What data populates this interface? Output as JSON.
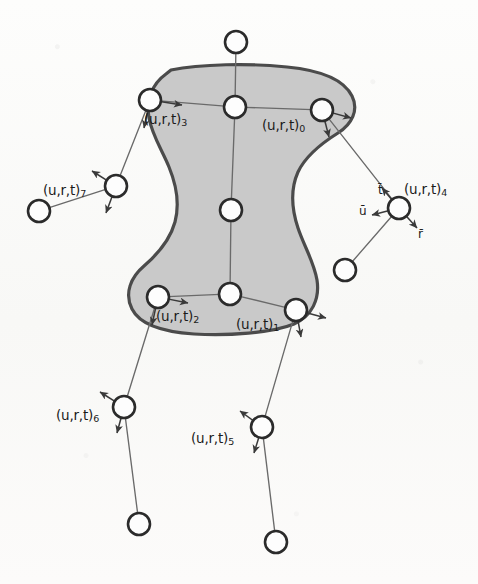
{
  "figure": {
    "background_color": "#fbfbfa",
    "blob_fill_color": "#c9c9c9",
    "blob_stroke_color": "#4b4b4b",
    "node_stroke_color": "#2b2b2b",
    "node_fill_color": "#fdfdfd",
    "link_color": "#6a6a6a",
    "arrow_color": "#3a3a3a",
    "text_color": "#1b1b1b"
  },
  "control_points": [
    {
      "id": "cp0",
      "label_base": "(u,r,t)",
      "index": "0",
      "cx": 322,
      "cy": 110,
      "r": 11,
      "inside_blob": true,
      "label_x": 262,
      "label_y": 119
    },
    {
      "id": "cp1",
      "label_base": "(u,r,t)",
      "index": "1",
      "cx": 296,
      "cy": 310,
      "r": 11,
      "inside_blob": true,
      "label_x": 236,
      "label_y": 318
    },
    {
      "id": "cp2",
      "label_base": "(u,r,t)",
      "index": "2",
      "cx": 158,
      "cy": 297,
      "r": 11,
      "inside_blob": true,
      "label_x": 156,
      "label_y": 310
    },
    {
      "id": "cp3",
      "label_base": "(u,r,t)",
      "index": "3",
      "cx": 150,
      "cy": 100,
      "r": 11,
      "inside_blob": true,
      "label_x": 144,
      "label_y": 113
    },
    {
      "id": "cp4",
      "label_base": "(u,r,t)",
      "index": "4",
      "cx": 399,
      "cy": 208,
      "r": 11,
      "inside_blob": false,
      "label_x": 404,
      "label_y": 183
    },
    {
      "id": "cp5",
      "label_base": "(u,r,t)",
      "index": "5",
      "cx": 262,
      "cy": 427,
      "r": 11,
      "inside_blob": false,
      "label_x": 191,
      "label_y": 432
    },
    {
      "id": "cp6",
      "label_base": "(u,r,t)",
      "index": "6",
      "cx": 124,
      "cy": 407,
      "r": 11,
      "inside_blob": false,
      "label_x": 56,
      "label_y": 409
    },
    {
      "id": "cp7",
      "label_base": "(u,r,t)",
      "index": "7",
      "cx": 116,
      "cy": 186,
      "r": 11,
      "inside_blob": false,
      "label_x": 43,
      "label_y": 184
    }
  ],
  "plain_nodes": [
    {
      "id": "n-top",
      "cx": 236,
      "cy": 42,
      "r": 11
    },
    {
      "id": "n-spine-top",
      "cx": 235,
      "cy": 107,
      "r": 11
    },
    {
      "id": "n-spine-mid",
      "cx": 231,
      "cy": 210,
      "r": 11
    },
    {
      "id": "n-spine-bot",
      "cx": 230,
      "cy": 294,
      "r": 11
    },
    {
      "id": "n-left-outer",
      "cx": 39,
      "cy": 211,
      "r": 11
    },
    {
      "id": "n-right-outer",
      "cx": 345,
      "cy": 270,
      "r": 11
    },
    {
      "id": "n-bot-left",
      "cx": 139,
      "cy": 524,
      "r": 11
    },
    {
      "id": "n-bot-right",
      "cx": 276,
      "cy": 542,
      "r": 11
    }
  ],
  "links": [
    {
      "id": "lk-top-spine",
      "from": "n-top",
      "to": "n-spine-top"
    },
    {
      "id": "lk-spine-upper",
      "from": "n-spine-top",
      "to": "n-spine-mid"
    },
    {
      "id": "lk-spine-lower",
      "from": "n-spine-mid",
      "to": "n-spine-bot"
    },
    {
      "id": "lk-cp3-spine",
      "from": "cp3",
      "to": "n-spine-top"
    },
    {
      "id": "lk-spine-cp0",
      "from": "n-spine-top",
      "to": "cp0"
    },
    {
      "id": "lk-cp2-spineb",
      "from": "cp2",
      "to": "n-spine-bot"
    },
    {
      "id": "lk-spineb-cp1",
      "from": "n-spine-bot",
      "to": "cp1"
    },
    {
      "id": "lk-cp3-cp7",
      "from": "cp3",
      "to": "cp7"
    },
    {
      "id": "lk-cp7-left",
      "from": "cp7",
      "to": "n-left-outer"
    },
    {
      "id": "lk-cp0-cp4",
      "from": "cp0",
      "to": "cp4"
    },
    {
      "id": "lk-cp4-right",
      "from": "cp4",
      "to": "n-right-outer"
    },
    {
      "id": "lk-cp2-cp6",
      "from": "cp2",
      "to": "cp6"
    },
    {
      "id": "lk-cp6-botl",
      "from": "cp6",
      "to": "n-bot-left"
    },
    {
      "id": "lk-cp1-cp5",
      "from": "cp1",
      "to": "cp5"
    },
    {
      "id": "lk-cp5-botr",
      "from": "cp5",
      "to": "n-bot-right"
    }
  ],
  "frame_arrows": [
    {
      "id": "fa-cp0-r",
      "owner": "cp0",
      "x1": 322,
      "y1": 110,
      "x2": 351,
      "y2": 118
    },
    {
      "id": "fa-cp0-u",
      "owner": "cp0",
      "x1": 322,
      "y1": 110,
      "x2": 329,
      "y2": 137
    },
    {
      "id": "fa-cp1-r",
      "owner": "cp1",
      "x1": 296,
      "y1": 310,
      "x2": 326,
      "y2": 318
    },
    {
      "id": "fa-cp1-u",
      "owner": "cp1",
      "x1": 296,
      "y1": 310,
      "x2": 301,
      "y2": 337
    },
    {
      "id": "fa-cp2-r",
      "owner": "cp2",
      "x1": 158,
      "y1": 297,
      "x2": 188,
      "y2": 303
    },
    {
      "id": "fa-cp2-u",
      "owner": "cp2",
      "x1": 158,
      "y1": 297,
      "x2": 152,
      "y2": 325
    },
    {
      "id": "fa-cp3-r",
      "owner": "cp3",
      "x1": 150,
      "y1": 100,
      "x2": 182,
      "y2": 105
    },
    {
      "id": "fa-cp3-u",
      "owner": "cp3",
      "x1": 150,
      "y1": 100,
      "x2": 144,
      "y2": 128
    },
    {
      "id": "fa-cp4-t",
      "owner": "cp4",
      "x1": 399,
      "y1": 208,
      "x2": 382,
      "y2": 188
    },
    {
      "id": "fa-cp4-u",
      "owner": "cp4",
      "x1": 399,
      "y1": 208,
      "x2": 372,
      "y2": 215
    },
    {
      "id": "fa-cp4-r",
      "owner": "cp4",
      "x1": 399,
      "y1": 208,
      "x2": 417,
      "y2": 228
    },
    {
      "id": "fa-cp5-t",
      "owner": "cp5",
      "x1": 262,
      "y1": 427,
      "x2": 240,
      "y2": 411
    },
    {
      "id": "fa-cp5-u",
      "owner": "cp5",
      "x1": 262,
      "y1": 427,
      "x2": 254,
      "y2": 453
    },
    {
      "id": "fa-cp6-t",
      "owner": "cp6",
      "x1": 124,
      "y1": 407,
      "x2": 100,
      "y2": 392
    },
    {
      "id": "fa-cp6-u",
      "owner": "cp6",
      "x1": 124,
      "y1": 407,
      "x2": 117,
      "y2": 433
    },
    {
      "id": "fa-cp7-t",
      "owner": "cp7",
      "x1": 116,
      "y1": 186,
      "x2": 92,
      "y2": 171
    },
    {
      "id": "fa-cp7-u",
      "owner": "cp7",
      "x1": 116,
      "y1": 186,
      "x2": 106,
      "y2": 213
    }
  ],
  "vector_labels": [
    {
      "id": "vec-t",
      "text": "t̄",
      "x": 378,
      "y": 184
    },
    {
      "id": "vec-u",
      "text": "ū",
      "x": 359,
      "y": 205
    },
    {
      "id": "vec-r",
      "text": "r̄",
      "x": 418,
      "y": 228
    }
  ],
  "blob": {
    "path": "M 171 70 C 200 64, 250 63, 287 67 C 318 70, 343 78, 352 96 C 359 110, 352 124, 338 133 C 322 143, 306 155, 298 172 C 290 190, 292 210, 298 228 C 304 246, 314 262, 317 280 C 320 299, 312 316, 294 324 C 272 333, 228 336, 194 334 C 164 332, 140 325, 132 309 C 124 293, 131 277, 144 266 C 158 254, 170 240, 175 222 C 180 203, 176 184, 169 167 C 162 150, 152 135, 149 118 C 146 100, 152 84, 166 74 Z"
  }
}
